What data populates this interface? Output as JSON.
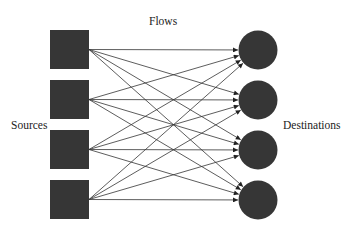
{
  "labels": {
    "flows": "Flows",
    "sources": "Sources",
    "destinations": "Destinations"
  },
  "colors": {
    "node_fill": "#363636",
    "edge_stroke": "#333333",
    "background": "#ffffff"
  },
  "sources": [
    {
      "id": "source-1",
      "shape": "square",
      "x": 50,
      "y": 30,
      "size": 39
    },
    {
      "id": "source-2",
      "shape": "square",
      "x": 50,
      "y": 80,
      "size": 39
    },
    {
      "id": "source-3",
      "shape": "square",
      "x": 50,
      "y": 130,
      "size": 39
    },
    {
      "id": "source-4",
      "shape": "square",
      "x": 50,
      "y": 180,
      "size": 39
    }
  ],
  "destinations": [
    {
      "id": "destination-1",
      "shape": "circle",
      "cx": 258,
      "cy": 50,
      "r": 19.5
    },
    {
      "id": "destination-2",
      "shape": "circle",
      "cx": 258,
      "cy": 100,
      "r": 19.5
    },
    {
      "id": "destination-3",
      "shape": "circle",
      "cx": 258,
      "cy": 150,
      "r": 19.5
    },
    {
      "id": "destination-4",
      "shape": "circle",
      "cx": 258,
      "cy": 200,
      "r": 19.5
    }
  ],
  "flows": {
    "connectivity": "complete-bipartite",
    "directed": true,
    "count": 16
  }
}
